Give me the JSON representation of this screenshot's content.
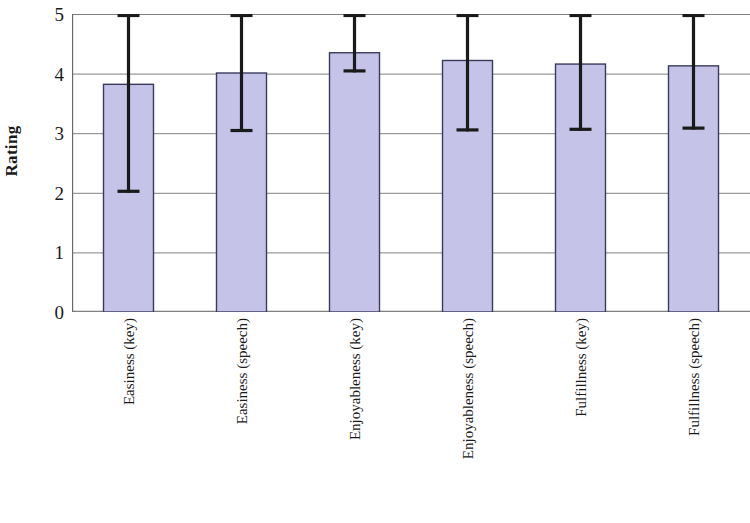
{
  "chart_data": {
    "type": "bar",
    "title": "",
    "subtitle": "",
    "xlabel": "",
    "ylabel": "Rating",
    "ylim": [
      0,
      5
    ],
    "ytick_labels": [
      "5",
      "4",
      "3",
      "2",
      "1",
      "0"
    ],
    "yticks": [
      5,
      4,
      3,
      2,
      1,
      0
    ],
    "grid": "horizontal",
    "legend": "none",
    "categories": [
      "Easiness (key)",
      "Easiness (speech)",
      "Enjoyableness (key)",
      "Enjoyableness (speech)",
      "Fulfillness (key)",
      "Fulfillness (speech)"
    ],
    "values": [
      3.82,
      4.01,
      4.35,
      4.22,
      4.16,
      4.13
    ],
    "error_upper": [
      5.0,
      5.0,
      5.0,
      5.0,
      5.0,
      5.0
    ],
    "error_lower": [
      2.0,
      3.02,
      4.02,
      3.03,
      3.04,
      3.06
    ],
    "series": [
      {
        "name": "Rating",
        "values": [
          3.82,
          4.01,
          4.35,
          4.22,
          4.16,
          4.13
        ]
      }
    ],
    "bar_fill_color": "#c5c4e8",
    "bar_border_color": "#3a3a5c",
    "error_bar_color": "#1a1a1a",
    "grid_color": "#808080",
    "axis_color": "#6b6b6b",
    "background_color": "#ffffff"
  }
}
